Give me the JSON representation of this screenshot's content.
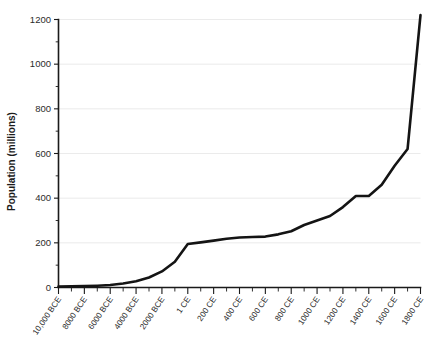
{
  "chart_data": {
    "type": "line",
    "title": "",
    "subtitle": "",
    "xlabel": "",
    "ylabel": "Population (millions)",
    "ylim": [
      0,
      1200
    ],
    "ytick_values": [
      0,
      200,
      400,
      600,
      800,
      1000,
      1200
    ],
    "ytick_labels": [
      "0",
      "200",
      "400",
      "600",
      "800",
      "1000",
      "1200"
    ],
    "yminor_values": [
      100,
      300,
      500,
      700,
      900,
      1100
    ],
    "grid": "horizontal-major-only",
    "legend": "none",
    "x_scale": "ordinal-non-linear",
    "xtick_labels": [
      "10,000 BCE",
      "8000 BCE",
      "6000 BCE",
      "4000 BCE",
      "2000 BCE",
      "1 CE",
      "200 CE",
      "400 CE",
      "600 CE",
      "800 CE",
      "1000 CE",
      "1200 CE",
      "1400 CE",
      "1600 CE",
      "1800 CE"
    ],
    "x": [
      "10,000 BCE",
      "9000 BCE",
      "8000 BCE",
      "7000 BCE",
      "6000 BCE",
      "5000 BCE",
      "4000 BCE",
      "3000 BCE",
      "2000 BCE",
      "1000 BCE",
      "1 CE",
      "100 CE",
      "200 CE",
      "300 CE",
      "400 CE",
      "500 CE",
      "600 CE",
      "700 CE",
      "800 CE",
      "900 CE",
      "1000 CE",
      "1100 CE",
      "1200 CE",
      "1300 CE",
      "1400 CE",
      "1500 CE",
      "1600 CE",
      "1700 CE",
      "1800 CE"
    ],
    "values": [
      4,
      5,
      6,
      8,
      11,
      18,
      28,
      45,
      72,
      115,
      195,
      202,
      210,
      218,
      224,
      226,
      228,
      238,
      252,
      280,
      300,
      320,
      360,
      410,
      410,
      460,
      545,
      620,
      1220
    ],
    "series": [
      {
        "name": "World population",
        "color": "#141414",
        "values": [
          4,
          5,
          6,
          8,
          11,
          18,
          28,
          45,
          72,
          115,
          195,
          202,
          210,
          218,
          224,
          226,
          228,
          238,
          252,
          280,
          300,
          320,
          360,
          410,
          410,
          460,
          545,
          620,
          1220
        ]
      }
    ],
    "annotations": []
  },
  "style": {
    "background": "#ffffff",
    "axis_color": "#1a1a1a",
    "grid_color": "#e6e6e6",
    "line_color": "#141414",
    "text_color": "#2b2b2b"
  }
}
